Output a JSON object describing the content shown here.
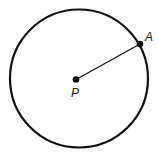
{
  "diagram": {
    "background": "#ffffff",
    "stroke_color": "#111111",
    "circle": {
      "cx": 79,
      "cy": 78.5,
      "r": 69,
      "stroke_width": 2.2
    },
    "points": [
      {
        "id": "P",
        "label": "P",
        "x": 76,
        "y": 79.5,
        "label_x": 71,
        "label_y": 97,
        "role": "center"
      },
      {
        "id": "A",
        "label": "A",
        "x": 140,
        "y": 44,
        "label_x": 145,
        "label_y": 41,
        "role": "on-circle"
      }
    ],
    "segment": {
      "from": "P",
      "to": "A",
      "stroke_width": 1.3
    }
  }
}
